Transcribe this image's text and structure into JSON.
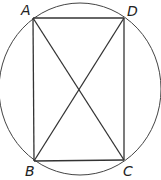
{
  "diagram": {
    "type": "rectangle inscribed in circle with diagonals",
    "stroke_color": "#333333",
    "points": {
      "A": {
        "label": "A",
        "x": 33,
        "y": 18
      },
      "D": {
        "label": "D",
        "x": 124,
        "y": 18
      },
      "B": {
        "label": "B",
        "x": 34,
        "y": 161
      },
      "C": {
        "label": "C",
        "x": 124,
        "y": 160
      }
    },
    "circle": {
      "cx": 80,
      "cy": 89,
      "rx": 81,
      "ry": 86
    },
    "segments": [
      "AD",
      "DC",
      "CB",
      "BA",
      "AC",
      "BD"
    ]
  }
}
